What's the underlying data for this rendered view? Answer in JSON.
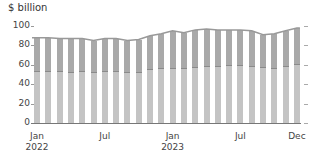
{
  "chart_data": {
    "type": "bar",
    "stacked": true,
    "title": "",
    "ylabel": "$ billion",
    "xlabel": "",
    "ylim": [
      0,
      100
    ],
    "yticks": [
      0,
      20,
      40,
      60,
      80,
      100
    ],
    "grid": false,
    "legend": null,
    "categories": [
      "Jan 2022",
      "Feb 2022",
      "Mar 2022",
      "Apr 2022",
      "May 2022",
      "Jun 2022",
      "Jul 2022",
      "Aug 2022",
      "Sep 2022",
      "Oct 2022",
      "Nov 2022",
      "Dec 2022",
      "Jan 2023",
      "Feb 2023",
      "Mar 2023",
      "Apr 2023",
      "May 2023",
      "Jun 2023",
      "Jul 2023",
      "Aug 2023",
      "Sep 2023",
      "Oct 2023",
      "Nov 2023",
      "Dec 2023"
    ],
    "xtick_labels": [
      {
        "index": 0,
        "label": "Jan",
        "sublabel": "2022"
      },
      {
        "index": 6,
        "label": "Jul",
        "sublabel": ""
      },
      {
        "index": 12,
        "label": "Jan",
        "sublabel": "2023"
      },
      {
        "index": 18,
        "label": "Jul",
        "sublabel": ""
      },
      {
        "index": 23,
        "label": "Dec",
        "sublabel": ""
      }
    ],
    "series": [
      {
        "name": "lower segment",
        "color": "#c4c4c4",
        "values": [
          54,
          54,
          54,
          53,
          54,
          53,
          54,
          54,
          53,
          53,
          56,
          57,
          57,
          57,
          58,
          59,
          59,
          60,
          60,
          59,
          58,
          57,
          59,
          61
        ]
      },
      {
        "name": "upper segment",
        "color": "#a9a9a9",
        "values": [
          34,
          34,
          33,
          34,
          33,
          32,
          33,
          33,
          32,
          33,
          34,
          35,
          38,
          36,
          38,
          38,
          37,
          36,
          36,
          36,
          33,
          35,
          36,
          37
        ]
      }
    ],
    "totals": [
      88,
      88,
      87,
      87,
      87,
      85,
      87,
      87,
      85,
      86,
      90,
      92,
      95,
      93,
      96,
      97,
      96,
      96,
      96,
      95,
      91,
      92,
      95,
      98
    ]
  }
}
